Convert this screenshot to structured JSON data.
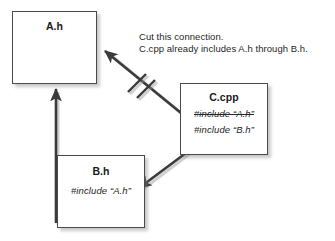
{
  "diagram": {
    "type": "include-dependency-diagram",
    "background_color": "#ffffff",
    "line_color": "#3b3b3b",
    "box_border_color": "#4a4a4a",
    "nodes": [
      {
        "id": "ah",
        "title": "A.h",
        "lines": []
      },
      {
        "id": "bh",
        "title": "B.h",
        "lines": [
          {
            "text": "#include “A.h”",
            "struck": false
          }
        ]
      },
      {
        "id": "ccpp",
        "title": "C.cpp",
        "lines": [
          {
            "text": "#include “A.h”",
            "struck": true
          },
          {
            "text": "#include “B.h”",
            "struck": false
          }
        ]
      }
    ],
    "caption": {
      "line1": "Cut this connection.",
      "line2": "C.cpp already includes A.h through B.h."
    },
    "connections": [
      {
        "id": "bh-to-ah",
        "from": "B.h",
        "to": "A.h",
        "style": "solid-arrow",
        "cut": false
      },
      {
        "id": "ccpp-to-ah",
        "from": "C.cpp",
        "to": "A.h",
        "style": "solid-arrow",
        "cut": true,
        "cut_marks": 2
      },
      {
        "id": "ccpp-to-bh",
        "from": "C.cpp",
        "to": "B.h",
        "style": "solid-arrow",
        "cut": false
      }
    ]
  }
}
